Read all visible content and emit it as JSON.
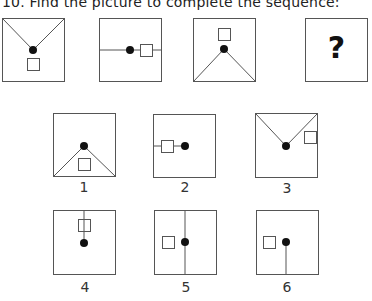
{
  "question": {
    "title": "10. Find the picture to complete the sequence:"
  },
  "sequence": [
    {
      "id": "seq-1",
      "description": "V lines from top corners to center dot, square below dot"
    },
    {
      "id": "seq-2",
      "description": "horizontal line through center, dot with square to the right"
    },
    {
      "id": "seq-3",
      "description": "lines from dot to bottom corners, square above dot"
    },
    {
      "id": "seq-4",
      "symbol": "?"
    }
  ],
  "options": [
    {
      "label": "1",
      "description": "lines from dot to bottom corners, square below dot"
    },
    {
      "label": "2",
      "description": "line from left edge to dot, square on the line left of dot"
    },
    {
      "label": "3",
      "description": "V lines from top corners to dot, square upper right"
    },
    {
      "label": "4",
      "description": "line from top edge through square down to dot"
    },
    {
      "label": "5",
      "description": "full vertical line through dot, square left of dot"
    },
    {
      "label": "6",
      "description": "line from dot down to bottom edge, square left of dot"
    }
  ],
  "colors": {
    "stroke": "#555555",
    "dot": "#111111"
  }
}
